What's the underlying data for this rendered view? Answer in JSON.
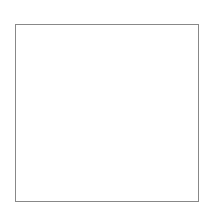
{
  "diagram": {
    "type": "dot-grid",
    "rows": 7,
    "cols": 7,
    "line_color": "#111111",
    "dot_color": "#111111",
    "border_color": "#888888",
    "shape_segments": [
      [
        [
          2,
          0
        ],
        [
          4,
          0
        ]
      ],
      [
        [
          2,
          0
        ],
        [
          1,
          1
        ]
      ],
      [
        [
          1,
          1
        ],
        [
          2,
          2
        ]
      ],
      [
        [
          2,
          2
        ],
        [
          1,
          3
        ]
      ],
      [
        [
          4,
          0
        ],
        [
          5,
          1
        ]
      ],
      [
        [
          5,
          1
        ],
        [
          4,
          2
        ]
      ],
      [
        [
          4,
          2
        ],
        [
          5,
          3
        ]
      ]
    ]
  }
}
